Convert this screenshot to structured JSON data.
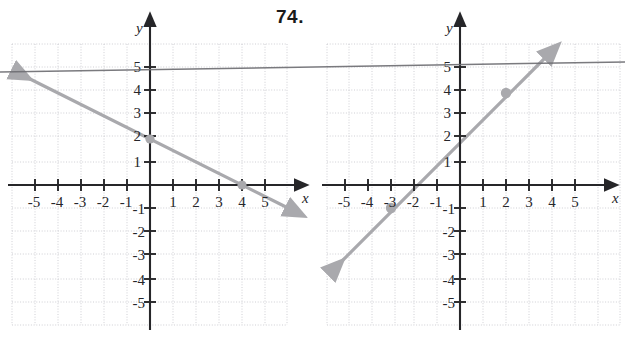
{
  "figure": {
    "number_label": "74.",
    "background": "#ffffff",
    "width": 625,
    "height": 339
  },
  "style": {
    "grid_color": "#c9c9cf",
    "axis_color": "#262629",
    "line_color": "#a9a9ad",
    "point_color": "#a9a9ad",
    "artifact_color": "#6f6f74",
    "label_color": "#26262a"
  },
  "artifact": {
    "name": "scan-line",
    "description": "dark near-horizontal scanning artifact spanning full page width",
    "y_left": 72,
    "y_right": 62
  },
  "chart_data": [
    {
      "type": "line",
      "name": "left-graph",
      "title": "",
      "xlabel": "x",
      "ylabel": "y",
      "xlim": [
        -6,
        6
      ],
      "ylim": [
        -6,
        6
      ],
      "xticks": [
        -5,
        -4,
        -3,
        -2,
        -1,
        1,
        2,
        3,
        4,
        5
      ],
      "yticks": [
        5,
        4,
        3,
        2,
        1,
        -1,
        -2,
        -3,
        -4,
        -5
      ],
      "xtick_labels": [
        "-5",
        "-4",
        "-3",
        "-2",
        "-1",
        "1",
        "2",
        "3",
        "4",
        "5"
      ],
      "ytick_labels": [
        "5",
        "4",
        "3",
        "2",
        "1",
        "-1",
        "-2",
        "-3",
        "-4",
        "-5"
      ],
      "grid": true,
      "legend": "none",
      "series": [
        {
          "name": "line-1",
          "slope": -0.5,
          "intercept": 2,
          "x": [
            -5.9,
            5.9
          ],
          "y": [
            4.95,
            -0.95
          ],
          "arrows": "both",
          "points": [
            {
              "x": 0,
              "y": 2,
              "label": "y-intercept"
            },
            {
              "x": 4,
              "y": 0,
              "label": "x-intercept"
            }
          ]
        }
      ]
    },
    {
      "type": "line",
      "name": "right-graph",
      "title": "",
      "xlabel": "x",
      "ylabel": "y",
      "xlim": [
        -6,
        6
      ],
      "ylim": [
        -6,
        6
      ],
      "xticks": [
        -5,
        -4,
        -3,
        -2,
        -1,
        1,
        2,
        3,
        4,
        5
      ],
      "yticks": [
        5,
        4,
        3,
        2,
        1,
        -1,
        -2,
        -3,
        -4,
        -5
      ],
      "xtick_labels": [
        "-5",
        "-4",
        "-3",
        "-2",
        "-1",
        "1",
        "2",
        "3",
        "4",
        "5"
      ],
      "ytick_labels": [
        "5",
        "4",
        "3",
        "2",
        "1",
        "-1",
        "-2",
        "-3",
        "-4",
        "-5"
      ],
      "grid": true,
      "legend": "none",
      "series": [
        {
          "name": "line-1",
          "slope": 1,
          "intercept": 2,
          "x": [
            -5.8,
            3.6
          ],
          "y": [
            -3.8,
            5.6
          ],
          "arrows": "both",
          "points": [
            {
              "x": -3,
              "y": -1,
              "label": "point-a"
            },
            {
              "x": 2,
              "y": 4,
              "label": "point-b"
            }
          ]
        }
      ]
    }
  ]
}
